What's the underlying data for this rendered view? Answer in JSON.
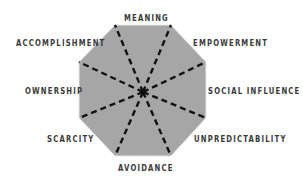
{
  "diagram": {
    "type": "octagon-framework",
    "fill_color": "#a6a6a6",
    "line_color": "#111111",
    "labels": {
      "meaning": "MEANING",
      "empowerment": "EMPOWERMENT",
      "social_influence": "SOCIAL INFLUENCE",
      "unpredictability": "UNPREDICTABILITY",
      "avoidance": "AVOIDANCE",
      "scarcity": "SCARCITY",
      "ownership": "OWNERSHIP",
      "accomplishment": "ACCOMPLISHMENT"
    }
  }
}
